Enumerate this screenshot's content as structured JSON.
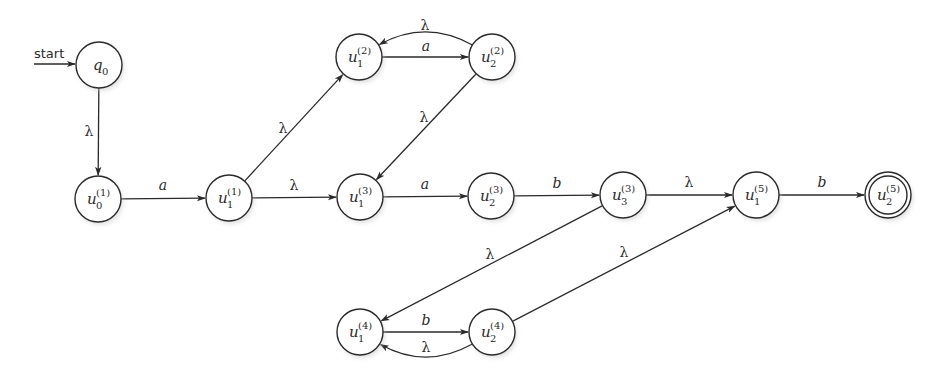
{
  "diagram": {
    "type": "finite-automaton",
    "start_label": "start",
    "start_state": "q0",
    "accepting_states": [
      "u2_5"
    ],
    "radius": 23,
    "colors": {
      "stroke": "#2a2a2a",
      "fill": "#ffffff",
      "background": "#ffffff"
    },
    "states": [
      {
        "id": "q0",
        "base": "q",
        "sub": "0",
        "sup": "",
        "x": 99,
        "y": 65,
        "accepting": false
      },
      {
        "id": "u0_1",
        "base": "u",
        "sub": "0",
        "sup": "(1)",
        "x": 98,
        "y": 199,
        "accepting": false
      },
      {
        "id": "u1_1",
        "base": "u",
        "sub": "1",
        "sup": "(1)",
        "x": 229,
        "y": 198,
        "accepting": false
      },
      {
        "id": "u1_2",
        "base": "u",
        "sub": "1",
        "sup": "(2)",
        "x": 359,
        "y": 57,
        "accepting": false
      },
      {
        "id": "u2_2",
        "base": "u",
        "sub": "2",
        "sup": "(2)",
        "x": 492,
        "y": 57,
        "accepting": false
      },
      {
        "id": "u1_3",
        "base": "u",
        "sub": "1",
        "sup": "(3)",
        "x": 360,
        "y": 197,
        "accepting": false
      },
      {
        "id": "u2_3",
        "base": "u",
        "sub": "2",
        "sup": "(3)",
        "x": 491,
        "y": 196,
        "accepting": false
      },
      {
        "id": "u3_3",
        "base": "u",
        "sub": "3",
        "sup": "(3)",
        "x": 623,
        "y": 195,
        "accepting": false
      },
      {
        "id": "u1_4",
        "base": "u",
        "sub": "1",
        "sup": "(4)",
        "x": 360,
        "y": 332,
        "accepting": false
      },
      {
        "id": "u2_4",
        "base": "u",
        "sub": "2",
        "sup": "(4)",
        "x": 492,
        "y": 332,
        "accepting": false
      },
      {
        "id": "u1_5",
        "base": "u",
        "sub": "1",
        "sup": "(5)",
        "x": 756,
        "y": 195,
        "accepting": false
      },
      {
        "id": "u2_5",
        "base": "u",
        "sub": "2",
        "sup": "(5)",
        "x": 888,
        "y": 195,
        "accepting": true
      }
    ],
    "transitions": [
      {
        "from": "q0",
        "to": "u0_1",
        "label": "λ",
        "curve": 0,
        "lx": 89,
        "ly": 136
      },
      {
        "from": "u0_1",
        "to": "u1_1",
        "label": "a",
        "curve": 0,
        "lx": 163,
        "ly": 190
      },
      {
        "from": "u1_1",
        "to": "u1_2",
        "label": "λ",
        "curve": 0,
        "lx": 283,
        "ly": 133
      },
      {
        "from": "u1_1",
        "to": "u1_3",
        "label": "λ",
        "curve": 0,
        "lx": 294,
        "ly": 190
      },
      {
        "from": "u1_2",
        "to": "u2_2",
        "label": "a",
        "curve": 0,
        "lx": 426,
        "ly": 51
      },
      {
        "from": "u2_2",
        "to": "u1_2",
        "label": "λ",
        "curve": 1,
        "lx": 425,
        "ly": 30
      },
      {
        "from": "u2_2",
        "to": "u1_3",
        "label": "λ",
        "curve": 0,
        "lx": 424,
        "ly": 122
      },
      {
        "from": "u1_3",
        "to": "u2_3",
        "label": "a",
        "curve": 0,
        "lx": 425,
        "ly": 189
      },
      {
        "from": "u2_3",
        "to": "u3_3",
        "label": "b",
        "curve": 0,
        "lx": 557,
        "ly": 188
      },
      {
        "from": "u3_3",
        "to": "u1_5",
        "label": "λ",
        "curve": 0,
        "lx": 689,
        "ly": 187
      },
      {
        "from": "u1_5",
        "to": "u2_5",
        "label": "b",
        "curve": 0,
        "lx": 822,
        "ly": 187
      },
      {
        "from": "u3_3",
        "to": "u1_4",
        "label": "λ",
        "curve": 0,
        "lx": 490,
        "ly": 259
      },
      {
        "from": "u1_4",
        "to": "u2_4",
        "label": "b",
        "curve": 0,
        "lx": 426,
        "ly": 325
      },
      {
        "from": "u2_4",
        "to": "u1_4",
        "label": "λ",
        "curve": -1,
        "lx": 426,
        "ly": 352
      },
      {
        "from": "u2_4",
        "to": "u1_5",
        "label": "λ",
        "curve": 0,
        "lx": 624,
        "ly": 257
      }
    ]
  }
}
